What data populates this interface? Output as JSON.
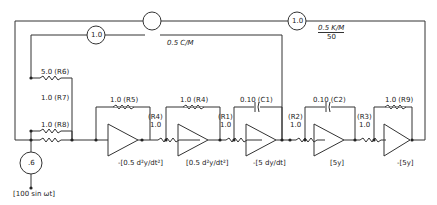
{
  "diagram": {
    "type": "analog computer circuit",
    "potentiometers": [
      {
        "id": "pot-top-outer",
        "value": "1.0",
        "label": "0.5 K/M",
        "label_den": "50"
      },
      {
        "id": "pot-top-inner",
        "value": "1.0",
        "label": "0.5 C/M"
      },
      {
        "id": "pot-source",
        "value": ".6"
      }
    ],
    "resistors": [
      {
        "id": "R6",
        "label": "5.0 (R6)"
      },
      {
        "id": "R7",
        "label": "1.0 (R7)"
      },
      {
        "id": "R8",
        "label": "1.0 (R8)"
      },
      {
        "id": "R5",
        "label": "1.0 (R5)"
      },
      {
        "id": "R4a",
        "label_top": "(R4)",
        "label_val": "1.0"
      },
      {
        "id": "R4",
        "label": "1.0 (R4)"
      },
      {
        "id": "R1",
        "label_top": "(R1)",
        "label_val": "1.0"
      },
      {
        "id": "R2",
        "label_top": "(R2)",
        "label_val": "1.0"
      },
      {
        "id": "R3",
        "label_top": "(R3)",
        "label_val": "1.0"
      },
      {
        "id": "R9",
        "label": "1.0 (R9)"
      }
    ],
    "capacitors": [
      {
        "id": "C1",
        "label": "0.10 (C1)"
      },
      {
        "id": "C2",
        "label": "0.10 (C2)"
      }
    ],
    "outputs": [
      {
        "id": "out1",
        "label": "-[0.5 d²y/dt²]"
      },
      {
        "id": "out2",
        "label": "[0.5 d²y/dt²]"
      },
      {
        "id": "out3",
        "label": "-[5 dy/dt]"
      },
      {
        "id": "out4",
        "label": "[5y]"
      },
      {
        "id": "out5",
        "label": "-[5y]"
      }
    ],
    "source": {
      "label": "[100 sin ωt]"
    }
  }
}
